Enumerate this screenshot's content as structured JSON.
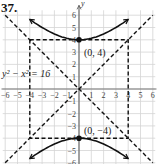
{
  "exercise_number": "37.",
  "chart_data": {
    "type": "line",
    "title": "37.",
    "equation": "y² − x² = 16",
    "xlabel": "x",
    "ylabel": "y",
    "xlim": [
      -6,
      6
    ],
    "ylim": [
      -6,
      6
    ],
    "grid": true,
    "x_ticks": [
      -6,
      -5,
      -4,
      -3,
      -2,
      -1,
      1,
      2,
      3,
      4,
      5,
      6
    ],
    "y_ticks": [
      -6,
      -5,
      -4,
      -3,
      -2,
      -1,
      1,
      2,
      3,
      4,
      5,
      6
    ],
    "series": [
      {
        "name": "upper branch",
        "style": "solid",
        "points": [
          [
            -4,
            5.66
          ],
          [
            -3,
            5
          ],
          [
            -2,
            4.47
          ],
          [
            -1,
            4.12
          ],
          [
            0,
            4
          ],
          [
            1,
            4.12
          ],
          [
            2,
            4.47
          ],
          [
            3,
            5
          ],
          [
            4,
            5.66
          ]
        ]
      },
      {
        "name": "lower branch",
        "style": "solid",
        "points": [
          [
            -4,
            -5.66
          ],
          [
            -3,
            -5
          ],
          [
            -2,
            -4.47
          ],
          [
            -1,
            -4.12
          ],
          [
            0,
            -4
          ],
          [
            1,
            -4.12
          ],
          [
            2,
            -4.47
          ],
          [
            3,
            -5
          ],
          [
            4,
            -5.66
          ]
        ]
      },
      {
        "name": "asymptote y = x",
        "style": "dashed",
        "points": [
          [
            -6,
            -6
          ],
          [
            6,
            6
          ]
        ]
      },
      {
        "name": "asymptote y = -x",
        "style": "dashed",
        "points": [
          [
            -6,
            6
          ],
          [
            6,
            -6
          ]
        ]
      },
      {
        "name": "fundamental rectangle",
        "style": "dashed",
        "points": [
          [
            -4,
            4
          ],
          [
            4,
            4
          ],
          [
            4,
            -4
          ],
          [
            -4,
            -4
          ],
          [
            -4,
            4
          ]
        ]
      }
    ],
    "annotations": [
      {
        "text": "(0, 4)",
        "x": 0,
        "y": 4,
        "type": "vertex"
      },
      {
        "text": "(0, −4)",
        "x": 0,
        "y": -4,
        "type": "vertex"
      },
      {
        "text": "y² − x² = 16",
        "x": -5.5,
        "y": 1.5,
        "type": "equation-label"
      }
    ]
  },
  "labels": {
    "vertex_top": "(0, 4)",
    "vertex_bottom": "(0, −4)",
    "equation": "y² − x² = 16",
    "x_axis": "x",
    "y_axis": "y"
  }
}
